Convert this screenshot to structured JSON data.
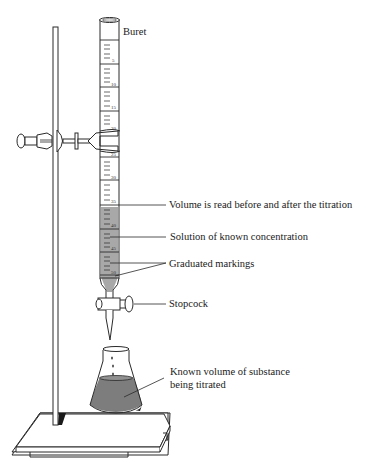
{
  "diagram": {
    "labels": {
      "buret": "Buret",
      "volume_read": "Volume is read before and after the titration",
      "solution": "Solution of known concentration",
      "graduated": "Graduated markings",
      "stopcock": "Stopcock",
      "flask_line1": "Known volume of substance",
      "flask_line2": "being titrated"
    },
    "scale_numbers": [
      "5",
      "10",
      "15",
      "20",
      "25",
      "30",
      "35",
      "40",
      "45",
      "50"
    ],
    "colors": {
      "line": "#2a2a2a",
      "liquid_buret": "#a8a8a8",
      "liquid_flask": "#7d7d7d",
      "background": "#ffffff"
    }
  }
}
